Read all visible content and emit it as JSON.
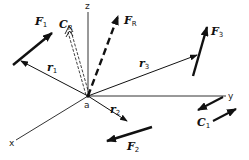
{
  "figure": {
    "origin_label": "a",
    "axes": {
      "x": "x",
      "y": "y",
      "z": "z"
    },
    "forces": [
      {
        "id": "F1",
        "symbol": "F",
        "subscript": "1"
      },
      {
        "id": "F2",
        "symbol": "F",
        "subscript": "2"
      },
      {
        "id": "F3",
        "symbol": "F",
        "subscript": "3"
      },
      {
        "id": "FR",
        "symbol": "F",
        "subscript": "R",
        "style": "dashed"
      }
    ],
    "position_vectors": [
      {
        "id": "r1",
        "symbol": "r",
        "subscript": "1"
      },
      {
        "id": "r2",
        "symbol": "r",
        "subscript": "2"
      },
      {
        "id": "r3",
        "symbol": "r",
        "subscript": "3"
      }
    ],
    "couples": [
      {
        "id": "C1",
        "symbol": "C",
        "subscript": "1"
      },
      {
        "id": "CR",
        "symbol": "C",
        "subscript": "R",
        "style": "double-dashed"
      }
    ],
    "colors": {
      "ink": "#111111",
      "axis": "#333333",
      "background": "#ffffff"
    }
  }
}
